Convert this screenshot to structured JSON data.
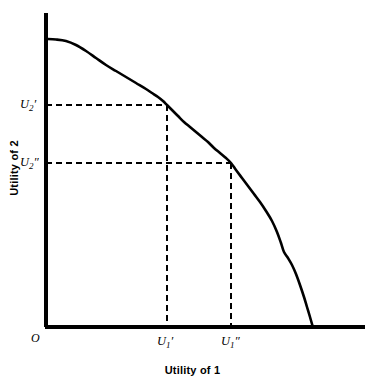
{
  "chart_data": {
    "type": "line",
    "title": "",
    "xlabel": "Utility of 1",
    "ylabel": "Utility of 2",
    "origin_label": "O",
    "grid": false,
    "legend": null,
    "axis_style": {
      "line_color": "#000000",
      "line_width": 4,
      "x_axis_y_px": 327,
      "y_axis_x_px": 46,
      "x_axis_start_px": 45,
      "x_axis_end_px": 365,
      "y_axis_top_px": 13,
      "y_axis_bottom_px": 327
    },
    "series": [
      {
        "name": "Utility possibility frontier",
        "color": "#000000",
        "width": 2.6,
        "points_px": [
          [
            46,
            39
          ],
          [
            56,
            39.5
          ],
          [
            66,
            41
          ],
          [
            76,
            45
          ],
          [
            86,
            51
          ],
          [
            96,
            58
          ],
          [
            106,
            65
          ],
          [
            116,
            71
          ],
          [
            126,
            77
          ],
          [
            136,
            83
          ],
          [
            146,
            89
          ],
          [
            152,
            93
          ],
          [
            158,
            97
          ],
          [
            163,
            101
          ],
          [
            167,
            105
          ],
          [
            172,
            110
          ],
          [
            178,
            116
          ],
          [
            184,
            122
          ],
          [
            190,
            127
          ],
          [
            196,
            132
          ],
          [
            202,
            137
          ],
          [
            208,
            142
          ],
          [
            214,
            148
          ],
          [
            220,
            153
          ],
          [
            226,
            158
          ],
          [
            231,
            163
          ],
          [
            236,
            170
          ],
          [
            242,
            178
          ],
          [
            248,
            186
          ],
          [
            254,
            194
          ],
          [
            260,
            202
          ],
          [
            266,
            211
          ],
          [
            272,
            221
          ],
          [
            277,
            232
          ],
          [
            281,
            243
          ],
          [
            284,
            252
          ],
          [
            288,
            258
          ],
          [
            292,
            265
          ],
          [
            296,
            274
          ],
          [
            300,
            285
          ],
          [
            304,
            297
          ],
          [
            307,
            307
          ],
          [
            310,
            317
          ],
          [
            312,
            324
          ],
          [
            313,
            327
          ]
        ]
      }
    ],
    "markers": [
      {
        "name": "allocation-prime",
        "x_px": 167,
        "y_px": 105,
        "x_label": "U1'",
        "y_label": "U2'"
      },
      {
        "name": "allocation-double-prime",
        "x_px": 231,
        "y_px": 163,
        "x_label": "U1\"",
        "y_label": "U2\""
      }
    ],
    "guide_lines": {
      "style": "dashed",
      "dash_px": [
        6,
        4
      ],
      "width": 2,
      "color": "#000000",
      "items": [
        {
          "name": "horizontal-u2-prime",
          "from_px": [
            46,
            105
          ],
          "to_px": [
            167,
            105
          ]
        },
        {
          "name": "vertical-u1-prime",
          "from_px": [
            167,
            105
          ],
          "to_px": [
            167,
            327
          ]
        },
        {
          "name": "horizontal-u2-dprime",
          "from_px": [
            46,
            163
          ],
          "to_px": [
            231,
            163
          ]
        },
        {
          "name": "vertical-u1-dprime",
          "from_px": [
            231,
            163
          ],
          "to_px": [
            231,
            327
          ]
        }
      ]
    },
    "tick_labels": {
      "y": [
        {
          "base": "U",
          "sub": "2",
          "prime": "′",
          "text": "U2′",
          "y_px": 105
        },
        {
          "base": "U",
          "sub": "2",
          "prime": "″",
          "text": "U2″",
          "y_px": 163
        }
      ],
      "x": [
        {
          "base": "U",
          "sub": "1",
          "prime": "′",
          "text": "U1′",
          "x_px": 167
        },
        {
          "base": "U",
          "sub": "1",
          "prime": "″",
          "text": "U1″",
          "x_px": 231
        }
      ]
    }
  },
  "figure": {
    "xaxis_title": "Utility of 1",
    "yaxis_title": "Utility of 2",
    "origin": "O",
    "y_tick_1_base": "U",
    "y_tick_1_sub": "2",
    "y_tick_1_prime": "′",
    "y_tick_2_base": "U",
    "y_tick_2_sub": "2",
    "y_tick_2_prime": "″",
    "x_tick_1_base": "U",
    "x_tick_1_sub": "1",
    "x_tick_1_prime": "′",
    "x_tick_2_base": "U",
    "x_tick_2_sub": "1",
    "x_tick_2_prime": "″"
  }
}
